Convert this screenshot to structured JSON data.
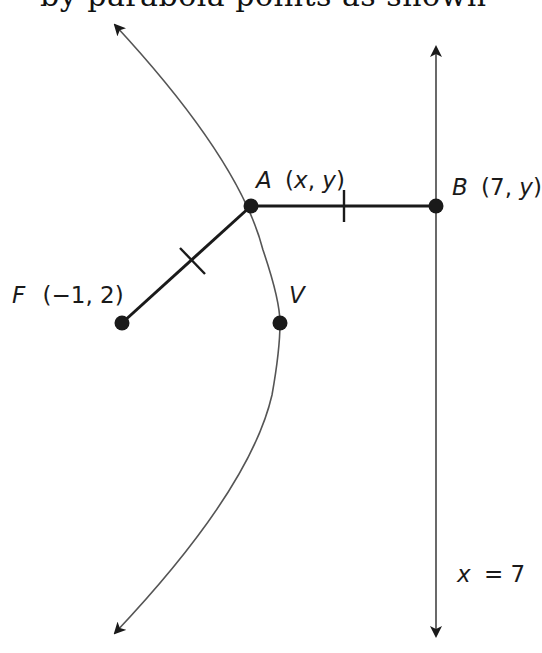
{
  "top_fragment": "by parabola points as shown",
  "diagram": {
    "type": "parabola-focus-directrix",
    "focus": {
      "name": "F",
      "coords": "(−1, 2)",
      "label_name": "F",
      "label_coords": "(−1, 2)"
    },
    "point_A": {
      "name": "A",
      "label_coords": "(x, y)"
    },
    "point_B": {
      "name": "B",
      "label_coords": "(7, y)"
    },
    "vertex": {
      "name": "V"
    },
    "directrix": {
      "label_var": "x",
      "label_eq": "= 7"
    },
    "congruent_segments": [
      "FA",
      "AB"
    ],
    "colors": {
      "stroke": "#1a1a1a",
      "curve": "#555555",
      "background": "#ffffff"
    }
  }
}
